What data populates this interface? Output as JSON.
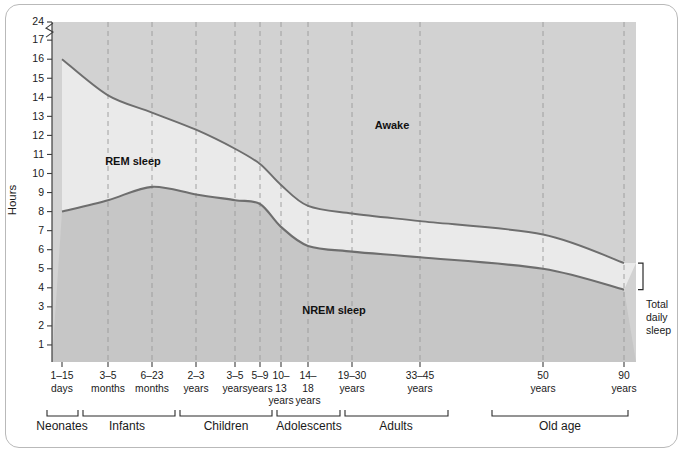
{
  "chart_data": {
    "type": "area",
    "title": "",
    "ylabel": "Hours",
    "xlabel": "",
    "ylim": [
      0,
      24
    ],
    "grid": true,
    "legend_position": "inline-annotations",
    "y_ticks": [
      1,
      2,
      3,
      4,
      5,
      6,
      7,
      8,
      9,
      10,
      11,
      12,
      13,
      14,
      15,
      16,
      17,
      24
    ],
    "y_axis_break_between": [
      17,
      24
    ],
    "x_tick_labels": [
      {
        "line1": "1–15",
        "line2": "days",
        "line3": ""
      },
      {
        "line1": "3–5",
        "line2": "months",
        "line3": ""
      },
      {
        "line1": "6–23",
        "line2": "months",
        "line3": ""
      },
      {
        "line1": "2–3",
        "line2": "years",
        "line3": ""
      },
      {
        "line1": "3–5",
        "line2": "years",
        "line3": ""
      },
      {
        "line1": "5–9",
        "line2": "years",
        "line3": ""
      },
      {
        "line1": "10–",
        "line2": "13",
        "line3": "years"
      },
      {
        "line1": "14–",
        "line2": "18",
        "line3": "years"
      },
      {
        "line1": "19–30",
        "line2": "years",
        "line3": ""
      },
      {
        "line1": "33–45",
        "line2": "years",
        "line3": ""
      },
      {
        "line1": "50",
        "line2": "years",
        "line3": ""
      },
      {
        "line1": "90",
        "line2": "years",
        "line3": ""
      }
    ],
    "age_groups": [
      {
        "label": "Neonates"
      },
      {
        "label": "Infants"
      },
      {
        "label": "Children"
      },
      {
        "label": "Adolescents"
      },
      {
        "label": "Adults"
      },
      {
        "label": "Old age"
      }
    ],
    "region_labels": [
      {
        "name": "awake",
        "text": "Awake"
      },
      {
        "name": "rem",
        "text": "REM sleep"
      },
      {
        "name": "nrem",
        "text": "NREM sleep"
      }
    ],
    "side_annotation": {
      "line1": "Total",
      "line2": "daily",
      "line3": "sleep"
    },
    "series": [
      {
        "name": "Total daily sleep",
        "description": "Upper boundary: total sleep (REM + NREM) in hours",
        "x_labels": [
          "1-15 days",
          "3-5 months",
          "6-23 months",
          "2-3 years",
          "3-5 years",
          "5-9 years",
          "10-13 years",
          "14-18 years",
          "19-30 years",
          "33-45 years",
          "50 years",
          "90 years"
        ],
        "values": [
          16.0,
          14.1,
          13.2,
          12.3,
          11.3,
          10.5,
          9.4,
          8.3,
          7.9,
          7.5,
          6.8,
          5.3
        ]
      },
      {
        "name": "NREM sleep",
        "description": "Lower boundary: NREM sleep in hours",
        "x_labels": [
          "1-15 days",
          "3-5 months",
          "6-23 months",
          "2-3 years",
          "3-5 years",
          "5-9 years",
          "10-13 years",
          "14-18 years",
          "19-30 years",
          "33-45 years",
          "50 years",
          "90 years"
        ],
        "values": [
          8.0,
          8.6,
          9.3,
          8.9,
          8.6,
          8.4,
          7.2,
          6.2,
          5.9,
          5.6,
          5.0,
          3.9
        ]
      }
    ],
    "colors": {
      "awake_fill": "#d2d2d2",
      "rem_fill": "#eaeaea",
      "nrem_fill": "#c6c6c6",
      "curve_stroke": "#6e6e6e",
      "gridline": "#9a9a9a",
      "axis": "#3c3c3c",
      "text": "#1a1a1a"
    }
  }
}
